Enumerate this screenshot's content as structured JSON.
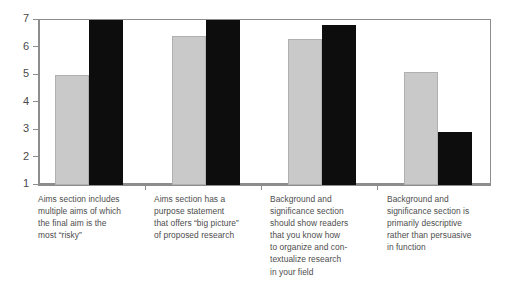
{
  "chart_data": {
    "type": "bar",
    "title": "",
    "subtitle": "",
    "xlabel": "",
    "ylabel": "",
    "ylim": [
      1,
      7
    ],
    "yticks": [
      1,
      2,
      3,
      4,
      5,
      6,
      7
    ],
    "ytick_labels": [
      "1",
      "2",
      "3",
      "4",
      "5",
      "6",
      "7"
    ],
    "grid": false,
    "legend": null,
    "legend_position": "none",
    "categories": [
      "Aims section includes\nmultiple aims of which\nthe final aim is the\nmost “risky”",
      "Aims section has a\npurpose statement\nthat offers “big picture”\nof proposed research",
      "Background and\nsignificance section\nshould show readers\nthat you know how\nto organize and con-\ntextualize research\nin your field",
      "Background and\nsignificance section is\nprimarily descriptive\nrather than persuasive\nin function"
    ],
    "series": [
      {
        "name": "series-gray",
        "color": "#c9c9c9",
        "values": [
          5.0,
          6.4,
          6.3,
          5.1
        ]
      },
      {
        "name": "series-black",
        "color": "#0d0d0d",
        "values": [
          7.0,
          7.0,
          6.8,
          2.9
        ]
      }
    ]
  },
  "axis": {
    "y_labels": [
      "7",
      "6",
      "5",
      "4",
      "3",
      "2",
      "1"
    ]
  }
}
